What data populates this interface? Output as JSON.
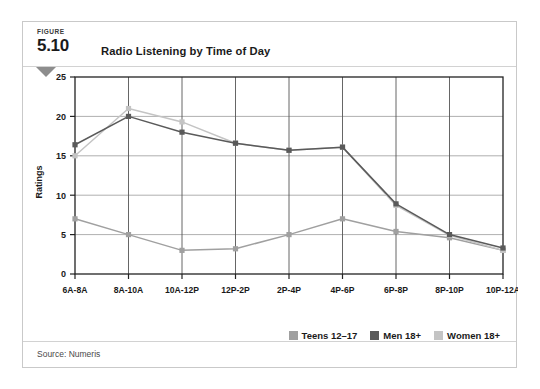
{
  "figure": {
    "kicker": "FIGURE",
    "number": "5.10",
    "title": "Radio Listening by Time of Day",
    "source": "Source: Numeris"
  },
  "legend": {
    "items": [
      {
        "label": "Teens 12–17",
        "color": "#a0a0a0"
      },
      {
        "label": "Men 18+",
        "color": "#5a5a5a"
      },
      {
        "label": "Women 18+",
        "color": "#c4c4c4"
      }
    ],
    "position": "bottom-right"
  },
  "chart_data": {
    "type": "line",
    "title": "Radio Listening by Time of Day",
    "xlabel": "",
    "ylabel": "Ratings",
    "categories": [
      "6A-8A",
      "8A-10A",
      "10A-12P",
      "12P-2P",
      "2P-4P",
      "4P-6P",
      "6P-8P",
      "8P-10P",
      "10P-12A"
    ],
    "series": [
      {
        "name": "Teens 12–17",
        "color": "#a0a0a0",
        "values": [
          7.0,
          5.0,
          3.0,
          3.2,
          5.0,
          7.0,
          5.4,
          4.6,
          3.0
        ]
      },
      {
        "name": "Men 18+",
        "color": "#5a5a5a",
        "values": [
          16.4,
          20.0,
          18.0,
          16.6,
          15.7,
          16.1,
          8.9,
          5.0,
          3.3
        ]
      },
      {
        "name": "Women 18+",
        "color": "#c4c4c4",
        "values": [
          15.0,
          21.0,
          19.3,
          16.6,
          15.7,
          16.1,
          8.7,
          4.9,
          3.0
        ]
      }
    ],
    "ylim": [
      0,
      25
    ],
    "yticks": [
      0,
      5,
      10,
      15,
      20,
      25
    ],
    "grid": true,
    "markers": "square"
  }
}
